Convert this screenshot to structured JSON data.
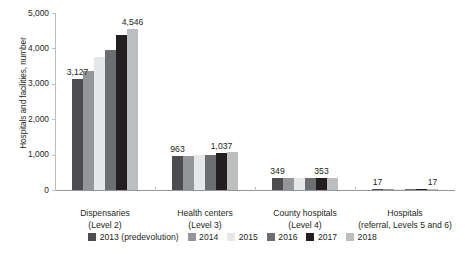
{
  "chart_data": {
    "type": "bar",
    "title": "",
    "xlabel": "",
    "ylabel": "Hospitals and facilities, number",
    "ylim": [
      0,
      5000
    ],
    "ytick_labels": [
      "5,000",
      "4,000",
      "3,000",
      "2,000",
      "1,000",
      "0"
    ],
    "ytick_values": [
      5000,
      4000,
      3000,
      2000,
      1000,
      0
    ],
    "grid": false,
    "legend_position": "bottom",
    "categories": [
      "Dispensaries (Level 2)",
      "Health centers (Level 3)",
      "County hospitals (Level 4)",
      "Hospitals (referral, Levels 5 and 6)"
    ],
    "category_lines": [
      {
        "line1": "Dispensaries",
        "line2": "(Level 2)"
      },
      {
        "line1": "Health centers",
        "line2": "(Level 3)"
      },
      {
        "line1": "County hospitals",
        "line2": "(Level 4)"
      },
      {
        "line1": "Hospitals",
        "line2": "(referral, Levels 5 and 6)"
      }
    ],
    "series": [
      {
        "name": "2013 (predevolution)",
        "color": "#4d4d4f",
        "values": [
          3127,
          963,
          349,
          17
        ]
      },
      {
        "name": "2014",
        "color": "#939598",
        "values": [
          3350,
          975,
          340,
          17
        ]
      },
      {
        "name": "2015",
        "color": "#e6e7e8",
        "values": [
          3750,
          980,
          345,
          17
        ]
      },
      {
        "name": "2016",
        "color": "#6d6e71",
        "values": [
          3950,
          1000,
          345,
          17
        ]
      },
      {
        "name": "2017",
        "color": "#231f20",
        "values": [
          4380,
          1037,
          353,
          17
        ]
      },
      {
        "name": "2018",
        "color": "#bcbec0",
        "values": [
          4546,
          1060,
          350,
          17
        ]
      }
    ],
    "value_labels": [
      {
        "text": "3,127",
        "group": 0,
        "series": 0
      },
      {
        "text": "4,546",
        "group": 0,
        "series": 5
      },
      {
        "text": "963",
        "group": 1,
        "series": 0
      },
      {
        "text": "1,037",
        "group": 1,
        "series": 4
      },
      {
        "text": "349",
        "group": 2,
        "series": 0
      },
      {
        "text": "353",
        "group": 2,
        "series": 4
      },
      {
        "text": "17",
        "group": 3,
        "series": 0
      },
      {
        "text": "17",
        "group": 3,
        "series": 5
      }
    ],
    "legend": [
      {
        "label": "2013 (predevolution)",
        "color": "#4d4d4f"
      },
      {
        "label": "2014",
        "color": "#939598"
      },
      {
        "label": "2015",
        "color": "#e6e7e8"
      },
      {
        "label": "2016",
        "color": "#6d6e71"
      },
      {
        "label": "2017",
        "color": "#231f20"
      },
      {
        "label": "2018",
        "color": "#bcbec0"
      }
    ]
  }
}
